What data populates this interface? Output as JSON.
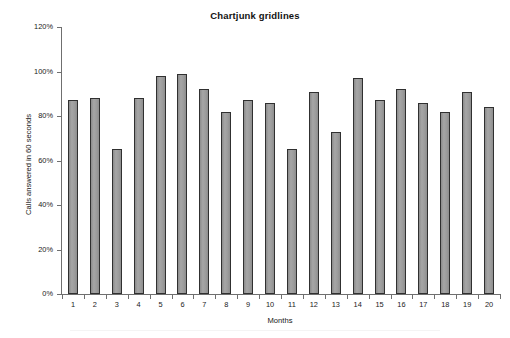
{
  "chart_data": {
    "type": "bar",
    "title": "Chartjunk gridlines",
    "xlabel": "Months",
    "ylabel": "Calls answered in 60 seconds",
    "categories": [
      "1",
      "2",
      "3",
      "4",
      "5",
      "6",
      "7",
      "8",
      "9",
      "10",
      "11",
      "12",
      "13",
      "14",
      "15",
      "16",
      "17",
      "18",
      "19",
      "20"
    ],
    "values": [
      87,
      88,
      65,
      88,
      98,
      99,
      92,
      82,
      87,
      86,
      65,
      91,
      73,
      97,
      87,
      92,
      86,
      82,
      91,
      84
    ],
    "value_unit": "%",
    "ylim": [
      0,
      120
    ],
    "ytick_values": [
      0,
      20,
      40,
      60,
      80,
      100,
      120
    ],
    "ytick_labels": [
      "0%",
      "20%",
      "40%",
      "60%",
      "80%",
      "100%",
      "120%"
    ],
    "grid": false,
    "legend": null,
    "legend_position": "none",
    "series": [
      {
        "name": "Calls answered in 60 seconds",
        "values": [
          87,
          88,
          65,
          88,
          98,
          99,
          92,
          82,
          87,
          86,
          65,
          91,
          73,
          97,
          87,
          92,
          86,
          82,
          91,
          84
        ]
      }
    ],
    "colors": {
      "bar_fill": "#9a9a9a",
      "bar_border": "#303030",
      "axis": "#6f6f6f",
      "text": "#1a1a1a",
      "background": "#ffffff"
    }
  }
}
